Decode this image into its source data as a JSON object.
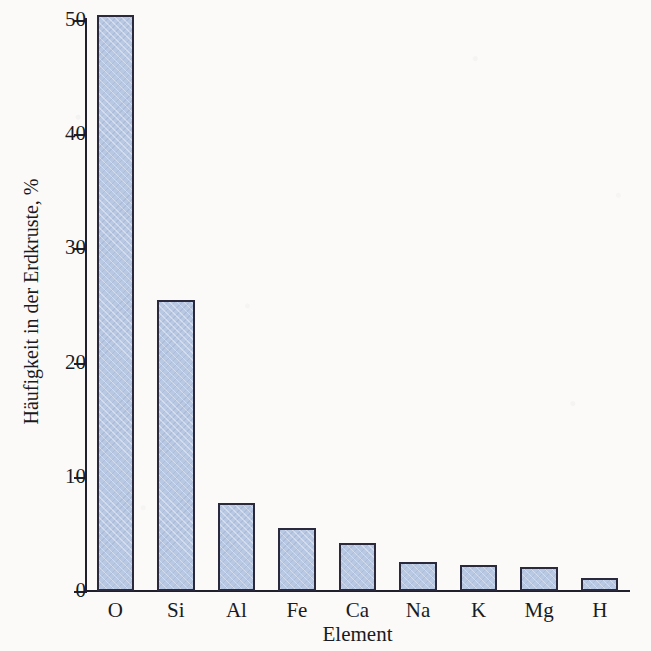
{
  "chart_data": {
    "type": "bar",
    "title": "",
    "xlabel": "Element",
    "ylabel": "Häufigkeit in der Erdkruste, %",
    "categories": [
      "O",
      "Si",
      "Al",
      "Fe",
      "Ca",
      "Na",
      "K",
      "Mg",
      "H"
    ],
    "values": [
      50.4,
      25.5,
      7.7,
      5.5,
      4.2,
      2.5,
      2.3,
      2.1,
      1.1
    ],
    "ylim": [
      0,
      50
    ],
    "yticks": [
      0,
      10,
      20,
      30,
      40,
      50
    ],
    "ytick_labels": [
      "0",
      "10",
      "20",
      "30",
      "40",
      "50"
    ],
    "grid": false,
    "legend": "none",
    "bar_fill_color": "#b9c8e3",
    "bar_edge_color": "#2a2a3c",
    "background_color": "#fbfaf8",
    "text_color": "#1a1a22"
  }
}
